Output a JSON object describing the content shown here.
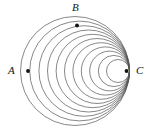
{
  "figure": {
    "type": "geometry-diagram",
    "canvas": {
      "width": 151,
      "height": 136,
      "background": "#ffffff"
    },
    "stroke_color": "#555555",
    "stroke_width": 0.7,
    "point_color": "#111111",
    "point_radius": 1.9,
    "tangency_point": {
      "x": 129.5,
      "y": 71
    },
    "circles": [
      {
        "name": "circle-1-outer",
        "cx": 75.0,
        "cy": 71.0,
        "r": 54.5
      },
      {
        "name": "circle-2",
        "cx": 79.6,
        "cy": 71.0,
        "r": 49.9
      },
      {
        "name": "circle-3",
        "cx": 84.2,
        "cy": 71.0,
        "r": 45.3
      },
      {
        "name": "circle-4",
        "cx": 88.5,
        "cy": 71.0,
        "r": 41.0
      },
      {
        "name": "circle-5",
        "cx": 92.8,
        "cy": 71.0,
        "r": 36.7
      },
      {
        "name": "circle-6",
        "cx": 97.0,
        "cy": 71.0,
        "r": 32.5
      },
      {
        "name": "circle-7",
        "cx": 101.2,
        "cy": 71.0,
        "r": 28.3
      },
      {
        "name": "circle-8",
        "cx": 105.4,
        "cy": 71.0,
        "r": 24.1
      },
      {
        "name": "circle-9",
        "cx": 109.6,
        "cy": 71.0,
        "r": 19.9
      },
      {
        "name": "circle-10",
        "cx": 113.9,
        "cy": 71.0,
        "r": 15.6
      },
      {
        "name": "circle-11-inner",
        "cx": 118.0,
        "cy": 71.0,
        "r": 11.5
      }
    ],
    "points": [
      {
        "id": "A",
        "label": "A",
        "x": 28.0,
        "y": 71.0,
        "label_x": 8,
        "label_y": 65
      },
      {
        "id": "B",
        "label": "B",
        "x": 77.0,
        "y": 25.5,
        "label_x": 72,
        "label_y": 2
      },
      {
        "id": "C",
        "label": "C",
        "x": 126.5,
        "y": 71.0,
        "label_x": 136,
        "label_y": 65
      }
    ]
  }
}
